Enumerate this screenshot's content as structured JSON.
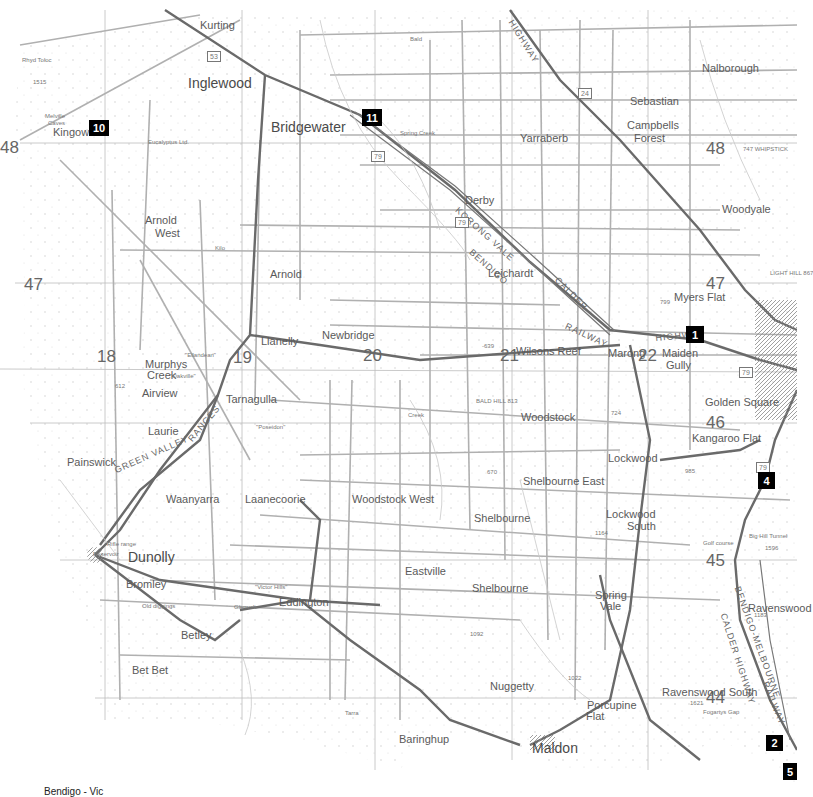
{
  "map": {
    "footer_label": "Bendigo - Vic",
    "markers": [
      {
        "id": "1",
        "label": "1",
        "x": 686,
        "y": 326,
        "w": 18,
        "h": 17
      },
      {
        "id": "2",
        "label": "2",
        "x": 766,
        "y": 735,
        "w": 17,
        "h": 16
      },
      {
        "id": "4",
        "label": "4",
        "x": 758,
        "y": 472,
        "w": 17,
        "h": 17
      },
      {
        "id": "5",
        "label": "5",
        "x": 783,
        "y": 763,
        "w": 14,
        "h": 17
      },
      {
        "id": "10",
        "label": "10",
        "x": 89,
        "y": 120,
        "w": 20,
        "h": 16
      },
      {
        "id": "11",
        "label": "11",
        "x": 362,
        "y": 109,
        "w": 20,
        "h": 17
      }
    ],
    "grid_numbers": [
      {
        "label": "48",
        "x": 0,
        "y": 139
      },
      {
        "label": "48",
        "x": 706,
        "y": 140
      },
      {
        "label": "47",
        "x": 24,
        "y": 276
      },
      {
        "label": "47",
        "x": 706,
        "y": 275
      },
      {
        "label": "18",
        "x": 97,
        "y": 348
      },
      {
        "label": "19",
        "x": 233,
        "y": 349
      },
      {
        "label": "20",
        "x": 363,
        "y": 347
      },
      {
        "label": "21",
        "x": 500,
        "y": 347
      },
      {
        "label": "22",
        "x": 638,
        "y": 347
      },
      {
        "label": "46",
        "x": 706,
        "y": 414
      },
      {
        "label": "45",
        "x": 706,
        "y": 552
      },
      {
        "label": "44",
        "x": 706,
        "y": 689
      }
    ],
    "towns": [
      {
        "name": "Kurting",
        "x": 200,
        "y": 20,
        "cls": "town"
      },
      {
        "name": "Inglewood",
        "x": 188,
        "y": 76,
        "cls": "town big"
      },
      {
        "name": "Bridgewater",
        "x": 271,
        "y": 120,
        "cls": "town big"
      },
      {
        "name": "Nalborough",
        "x": 702,
        "y": 63,
        "cls": "town"
      },
      {
        "name": "Sebastian",
        "x": 630,
        "y": 96,
        "cls": "town"
      },
      {
        "name": "Campbells",
        "x": 627,
        "y": 120,
        "cls": "town"
      },
      {
        "name": "Forest",
        "x": 634,
        "y": 133,
        "cls": "town"
      },
      {
        "name": "Yarraberb",
        "x": 520,
        "y": 133,
        "cls": "town"
      },
      {
        "name": "Kingower",
        "x": 53,
        "y": 127,
        "cls": "town"
      },
      {
        "name": "Derby",
        "x": 465,
        "y": 195,
        "cls": "town"
      },
      {
        "name": "Woodyale",
        "x": 722,
        "y": 204,
        "cls": "town"
      },
      {
        "name": "Arnold",
        "x": 145,
        "y": 215,
        "cls": "town"
      },
      {
        "name": "West",
        "x": 155,
        "y": 228,
        "cls": "town"
      },
      {
        "name": "Arnold",
        "x": 270,
        "y": 269,
        "cls": "town"
      },
      {
        "name": "Leichardt",
        "x": 488,
        "y": 268,
        "cls": "town"
      },
      {
        "name": "Myers Flat",
        "x": 674,
        "y": 292,
        "cls": "town"
      },
      {
        "name": "Newbridge",
        "x": 322,
        "y": 330,
        "cls": "town"
      },
      {
        "name": "Llanelly",
        "x": 261,
        "y": 336,
        "cls": "town"
      },
      {
        "name": "Wilsons Reef",
        "x": 516,
        "y": 346,
        "cls": "town"
      },
      {
        "name": "Marong",
        "x": 608,
        "y": 348,
        "cls": "town"
      },
      {
        "name": "Maiden",
        "x": 662,
        "y": 348,
        "cls": "town"
      },
      {
        "name": "Gully",
        "x": 666,
        "y": 360,
        "cls": "town"
      },
      {
        "name": "Murphys",
        "x": 145,
        "y": 359,
        "cls": "town"
      },
      {
        "name": "Creek",
        "x": 147,
        "y": 370,
        "cls": "town"
      },
      {
        "name": "Airview",
        "x": 142,
        "y": 388,
        "cls": "town"
      },
      {
        "name": "Tarnagulla",
        "x": 226,
        "y": 394,
        "cls": "town"
      },
      {
        "name": "Woodstock",
        "x": 521,
        "y": 412,
        "cls": "town"
      },
      {
        "name": "Golden Square",
        "x": 705,
        "y": 397,
        "cls": "town"
      },
      {
        "name": "Laurie",
        "x": 148,
        "y": 426,
        "cls": "town"
      },
      {
        "name": "Kangaroo Flat",
        "x": 692,
        "y": 433,
        "cls": "town"
      },
      {
        "name": "Lockwood",
        "x": 608,
        "y": 453,
        "cls": "town"
      },
      {
        "name": "Painswick",
        "x": 67,
        "y": 457,
        "cls": "town"
      },
      {
        "name": "Shelbourne East",
        "x": 523,
        "y": 476,
        "cls": "town"
      },
      {
        "name": "Waanyarra",
        "x": 166,
        "y": 494,
        "cls": "town"
      },
      {
        "name": "Laanecoorie",
        "x": 245,
        "y": 494,
        "cls": "town"
      },
      {
        "name": "Woodstock West",
        "x": 352,
        "y": 494,
        "cls": "town"
      },
      {
        "name": "Shelbourne",
        "x": 474,
        "y": 513,
        "cls": "town"
      },
      {
        "name": "Lockwood",
        "x": 606,
        "y": 509,
        "cls": "town"
      },
      {
        "name": "South",
        "x": 627,
        "y": 521,
        "cls": "town"
      },
      {
        "name": "Dunolly",
        "x": 128,
        "y": 550,
        "cls": "town big"
      },
      {
        "name": "Eastville",
        "x": 405,
        "y": 566,
        "cls": "town"
      },
      {
        "name": "Shelbourne",
        "x": 472,
        "y": 583,
        "cls": "town"
      },
      {
        "name": "Spring",
        "x": 595,
        "y": 590,
        "cls": "town"
      },
      {
        "name": "Vale",
        "x": 600,
        "y": 601,
        "cls": "town"
      },
      {
        "name": "Ravenswood",
        "x": 748,
        "y": 603,
        "cls": "town"
      },
      {
        "name": "Bromley",
        "x": 126,
        "y": 579,
        "cls": "town"
      },
      {
        "name": "Eddington",
        "x": 279,
        "y": 597,
        "cls": "town"
      },
      {
        "name": "Betley",
        "x": 181,
        "y": 630,
        "cls": "town"
      },
      {
        "name": "Bet Bet",
        "x": 132,
        "y": 665,
        "cls": "town"
      },
      {
        "name": "Nuggetty",
        "x": 490,
        "y": 681,
        "cls": "town"
      },
      {
        "name": "Ravenswood South",
        "x": 662,
        "y": 687,
        "cls": "town"
      },
      {
        "name": "Porcupine",
        "x": 587,
        "y": 700,
        "cls": "town"
      },
      {
        "name": "Flat",
        "x": 586,
        "y": 711,
        "cls": "town"
      },
      {
        "name": "Baringhup",
        "x": 399,
        "y": 734,
        "cls": "town"
      },
      {
        "name": "Maldon",
        "x": 532,
        "y": 741,
        "cls": "town big"
      }
    ],
    "minor_labels": [
      {
        "text": "Rhyd Toloc",
        "x": 22,
        "y": 57
      },
      {
        "text": "1515",
        "x": 33,
        "y": 79
      },
      {
        "text": "Melville",
        "x": 45,
        "y": 113
      },
      {
        "text": "Caves",
        "x": 48,
        "y": 120
      },
      {
        "text": "Eucalyptus Ltd.",
        "x": 148,
        "y": 139
      },
      {
        "text": "Kilo",
        "x": 215,
        "y": 245
      },
      {
        "text": "Bald",
        "x": 410,
        "y": 36
      },
      {
        "text": "\"Ellandean\"",
        "x": 185,
        "y": 352
      },
      {
        "text": "\"Oakville\"",
        "x": 170,
        "y": 373
      },
      {
        "text": "612",
        "x": 115,
        "y": 383
      },
      {
        "text": "\"Poseidon\"",
        "x": 256,
        "y": 424
      },
      {
        "text": "BALD HILL 813",
        "x": 476,
        "y": 398
      },
      {
        "text": "-639",
        "x": 482,
        "y": 343
      },
      {
        "text": "799",
        "x": 660,
        "y": 299
      },
      {
        "text": "670",
        "x": 487,
        "y": 469
      },
      {
        "text": "724",
        "x": 611,
        "y": 410
      },
      {
        "text": "985",
        "x": 685,
        "y": 468
      },
      {
        "text": "1164",
        "x": 595,
        "y": 530
      },
      {
        "text": "1092",
        "x": 470,
        "y": 631
      },
      {
        "text": "1022",
        "x": 568,
        "y": 675
      },
      {
        "text": "1621",
        "x": 690,
        "y": 700
      },
      {
        "text": "1183",
        "x": 754,
        "y": 612
      },
      {
        "text": "1596",
        "x": 765,
        "y": 545
      },
      {
        "text": "Rifle range",
        "x": 107,
        "y": 541
      },
      {
        "text": "Reservoir",
        "x": 93,
        "y": 551
      },
      {
        "text": "Old diggings",
        "x": 142,
        "y": 603
      },
      {
        "text": "Glenvale",
        "x": 234,
        "y": 604
      },
      {
        "text": "\"Victor Hills\"",
        "x": 255,
        "y": 584
      },
      {
        "text": "Tarra",
        "x": 345,
        "y": 710
      },
      {
        "text": "Golf course",
        "x": 703,
        "y": 540
      },
      {
        "text": "Big Hill Tunnel",
        "x": 749,
        "y": 533
      },
      {
        "text": "Fogartys Gap",
        "x": 703,
        "y": 709
      },
      {
        "text": "747 WHIPSTICK",
        "x": 743,
        "y": 146
      },
      {
        "text": "LIGHT HILL 867",
        "x": 770,
        "y": 270
      },
      {
        "text": "Spring Creek",
        "x": 400,
        "y": 130
      },
      {
        "text": "Creek",
        "x": 408,
        "y": 412
      }
    ],
    "road_labels": [
      {
        "text": "HIGHWAY",
        "x": 515,
        "y": 18,
        "angle": 58
      },
      {
        "text": "KORONG VALE",
        "x": 460,
        "y": 205,
        "angle": 42
      },
      {
        "text": "BENDIGO",
        "x": 474,
        "y": 247,
        "angle": 42
      },
      {
        "text": "CALDER",
        "x": 560,
        "y": 275,
        "angle": 45
      },
      {
        "text": "RAILWAY",
        "x": 568,
        "y": 321,
        "angle": 25
      },
      {
        "text": "HIGHWAY",
        "x": 655,
        "y": 333,
        "angle": -5
      },
      {
        "text": "GREEN VALLEY",
        "x": 113,
        "y": 466,
        "angle": -24
      },
      {
        "text": "RANGES",
        "x": 186,
        "y": 437,
        "angle": -50
      },
      {
        "text": "BENDIGO-MELBOURNE",
        "x": 742,
        "y": 585,
        "angle": 70
      },
      {
        "text": "CALDER HIGHWAY",
        "x": 728,
        "y": 612,
        "angle": 72
      },
      {
        "text": "RAILWAY",
        "x": 770,
        "y": 680,
        "angle": 68
      }
    ],
    "route_numbers": [
      {
        "text": "79",
        "x": 371,
        "y": 151
      },
      {
        "text": "79",
        "x": 455,
        "y": 217
      },
      {
        "text": "79",
        "x": 739,
        "y": 367
      },
      {
        "text": "79",
        "x": 756,
        "y": 462
      },
      {
        "text": "53",
        "x": 207,
        "y": 51
      },
      {
        "text": "24",
        "x": 578,
        "y": 88
      }
    ]
  }
}
